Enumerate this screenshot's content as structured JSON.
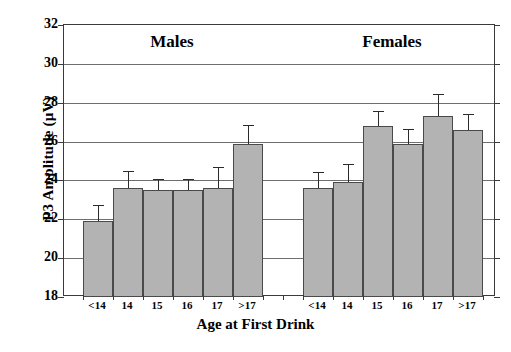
{
  "chart_data": {
    "type": "bar",
    "title": "",
    "xlabel": "Age at First Drink",
    "ylabel": "P3 Amplitude (µV)",
    "ylim": [
      18,
      32
    ],
    "yticks": [
      18,
      20,
      22,
      24,
      26,
      28,
      30,
      32
    ],
    "grid": true,
    "legend": "none",
    "group_labels": [
      "Males",
      "Females"
    ],
    "categories": [
      "<14",
      "14",
      "15",
      "16",
      "17",
      ">17"
    ],
    "series": [
      {
        "name": "Males",
        "categories": [
          "<14",
          "14",
          "15",
          "16",
          "17",
          ">17"
        ],
        "values": [
          21.9,
          23.6,
          23.5,
          23.5,
          23.6,
          25.9
        ],
        "errors": [
          0.85,
          0.9,
          0.55,
          0.55,
          1.1,
          0.95
        ]
      },
      {
        "name": "Females",
        "categories": [
          "<14",
          "14",
          "15",
          "16",
          "17",
          ">17"
        ],
        "values": [
          23.6,
          23.9,
          26.8,
          25.9,
          27.3,
          26.6
        ],
        "errors": [
          0.85,
          0.95,
          0.75,
          0.75,
          1.15,
          0.8
        ]
      }
    ],
    "colors": {
      "bar_fill": "#b3b3b3",
      "bar_stroke": "#4a4a4a",
      "error_bar": "#2b2b2b",
      "gridline": "#6e6e6e",
      "axis": "#3a3a3a",
      "text": "#000000",
      "background": "#ffffff"
    }
  },
  "caption": {
    "sliver_text": ""
  }
}
